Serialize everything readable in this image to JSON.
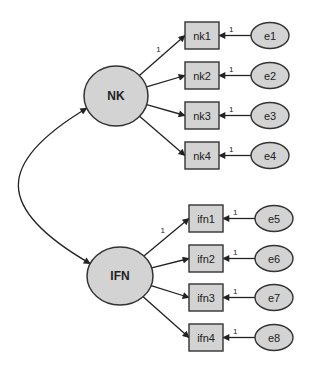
{
  "diagram": {
    "type": "SEM confirmatory factor analysis path diagram",
    "colors": {
      "node_fill": "#d3d3d3",
      "stroke": "#333333",
      "background": "#ffffff"
    },
    "latents": [
      {
        "id": "NK",
        "label": "NK",
        "cx": 116,
        "cy": 96,
        "rx": 32,
        "ry": 30
      },
      {
        "id": "IFN",
        "label": "IFN",
        "cx": 120,
        "cy": 276,
        "rx": 33,
        "ry": 29
      }
    ],
    "observed": [
      {
        "id": "nk1",
        "label": "nk1",
        "latent": "NK",
        "x": 185,
        "y": 22,
        "error": "e1",
        "loading_label": "1",
        "error_label": "1"
      },
      {
        "id": "nk2",
        "label": "nk2",
        "latent": "NK",
        "x": 185,
        "y": 62,
        "error": "e2",
        "loading_label": "",
        "error_label": "1"
      },
      {
        "id": "nk3",
        "label": "nk3",
        "latent": "NK",
        "x": 185,
        "y": 102,
        "error": "e3",
        "loading_label": "",
        "error_label": "1"
      },
      {
        "id": "nk4",
        "label": "nk4",
        "latent": "NK",
        "x": 185,
        "y": 142,
        "error": "e4",
        "loading_label": "",
        "error_label": "1"
      },
      {
        "id": "ifn1",
        "label": "ifn1",
        "latent": "IFN",
        "x": 189,
        "y": 205,
        "error": "e5",
        "loading_label": "1",
        "error_label": "1"
      },
      {
        "id": "ifn2",
        "label": "ifn2",
        "latent": "IFN",
        "x": 189,
        "y": 245,
        "error": "e6",
        "loading_label": "",
        "error_label": "1"
      },
      {
        "id": "ifn3",
        "label": "ifn3",
        "latent": "IFN",
        "x": 189,
        "y": 284,
        "error": "e7",
        "loading_label": "",
        "error_label": "1"
      },
      {
        "id": "ifn4",
        "label": "ifn4",
        "latent": "IFN",
        "x": 189,
        "y": 324,
        "error": "e8",
        "loading_label": "",
        "error_label": "1"
      }
    ],
    "errors": [
      {
        "id": "e1",
        "label": "e1"
      },
      {
        "id": "e2",
        "label": "e2"
      },
      {
        "id": "e3",
        "label": "e3"
      },
      {
        "id": "e4",
        "label": "e4"
      },
      {
        "id": "e5",
        "label": "e5"
      },
      {
        "id": "e6",
        "label": "e6"
      },
      {
        "id": "e7",
        "label": "e7"
      },
      {
        "id": "e8",
        "label": "e8"
      }
    ],
    "covariances": [
      {
        "from": "NK",
        "to": "IFN",
        "label": ""
      }
    ]
  },
  "caption": ""
}
